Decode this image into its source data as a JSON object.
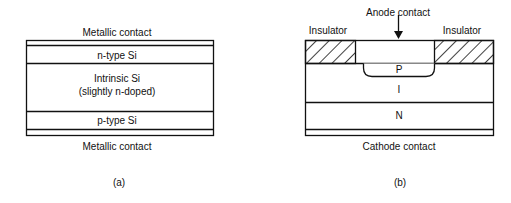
{
  "figure_a": {
    "top_contact": "Metallic contact",
    "n_layer": "n-type Si",
    "intrinsic_line1": "Intrinsic Si",
    "intrinsic_line2": "(slightly n-doped)",
    "p_layer": "p-type Si",
    "bottom_contact": "Metallic contact",
    "caption": "(a)"
  },
  "figure_b": {
    "anode": "Anode contact",
    "insulator_left": "Insulator",
    "insulator_right": "Insulator",
    "p_region": "P",
    "i_region": "I",
    "n_region": "N",
    "cathode": "Cathode contact",
    "caption": "(b)"
  }
}
